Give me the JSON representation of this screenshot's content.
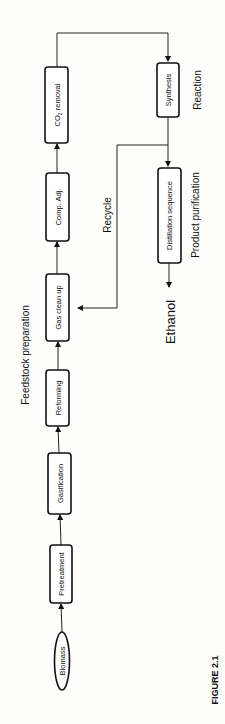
{
  "diagram": {
    "nodes": {
      "biomass": "Biomass",
      "pretreatment": "Pretreatment",
      "gasification": "Gasification",
      "reforming": "Reforming",
      "gas_clean_up": "Gas clean up",
      "comp_adj": "Comp. Adj.",
      "co2_removal_main": "CO",
      "co2_removal_sub": "2",
      "co2_removal_rest": " removal",
      "synthesis": "Synthesis",
      "distillation": "Distillation sequence",
      "ethanol": "Ethanol"
    },
    "stage_labels": {
      "feedstock": "Feedstock preparation",
      "reaction": "Reaction",
      "purification": "Product purification",
      "recycle": "Recycle"
    },
    "caption": "FIGURE 2.1",
    "flow": [
      "Biomass",
      "Pretreatment",
      "Gasification",
      "Reforming",
      "Gas clean up",
      "Comp. Adj.",
      "CO2 removal",
      "Synthesis",
      "Distillation sequence",
      "Ethanol"
    ],
    "recycle_from": "Synthesis",
    "recycle_to": "Gas clean up"
  }
}
